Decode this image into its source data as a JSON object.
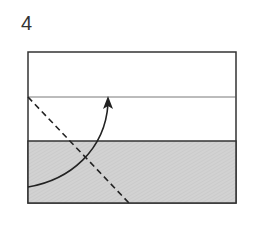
{
  "step": {
    "number": "4"
  },
  "diagram": {
    "paper_fill_top": "#ffffff",
    "paper_fill_bottom": "#d0d0d0",
    "line_color": "#222222",
    "elements": [
      "paper-rectangle",
      "crease-line",
      "colored-flap",
      "valley-fold-dashed-line",
      "fold-arrow"
    ]
  }
}
